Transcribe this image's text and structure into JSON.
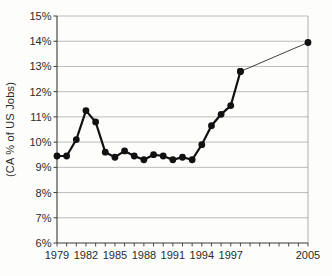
{
  "chart_data": {
    "type": "line",
    "title": "",
    "xlabel": "",
    "ylabel": "(CA % of US Jobs)",
    "xlim": [
      1979,
      2005
    ],
    "ylim": [
      6,
      15
    ],
    "grid": "horizontal",
    "legend_position": "none",
    "y_tick_labels": [
      "6%",
      "7%",
      "8%",
      "9%",
      "10%",
      "11%",
      "12%",
      "13%",
      "14%",
      "15%"
    ],
    "y_tick_values": [
      6,
      7,
      8,
      9,
      10,
      11,
      12,
      13,
      14,
      15
    ],
    "x_tick_labels": [
      "1979",
      "1982",
      "1985",
      "1988",
      "1991",
      "1994",
      "1997",
      "2005"
    ],
    "x_tick_values": [
      1979,
      1982,
      1985,
      1988,
      1991,
      1994,
      1997,
      2005
    ],
    "minor_x_tick_step_years": 1,
    "series": [
      {
        "name": "CA share of US jobs 1979-1998",
        "line_style": "thick",
        "markers": true,
        "x": [
          1979,
          1980,
          1981,
          1982,
          1983,
          1984,
          1985,
          1986,
          1987,
          1988,
          1989,
          1990,
          1991,
          1992,
          1993,
          1994,
          1995,
          1996,
          1997,
          1998
        ],
        "y": [
          9.45,
          9.45,
          10.1,
          11.25,
          10.8,
          9.6,
          9.4,
          9.65,
          9.45,
          9.3,
          9.5,
          9.45,
          9.3,
          9.4,
          9.3,
          9.9,
          10.65,
          11.1,
          11.45,
          12.8
        ]
      },
      {
        "name": "connector 1998 to 2005",
        "line_style": "thin",
        "markers": true,
        "x": [
          1998,
          2005
        ],
        "y": [
          12.8,
          13.95
        ]
      }
    ],
    "marker": {
      "shape": "circle",
      "radius": 3.4
    },
    "colors": {
      "line": "#111111",
      "marker": "#111111",
      "grid": "#ababab",
      "axis": "#3a3a3a",
      "plot_border": "#9a9a9a",
      "text": "#2a2a2a",
      "background": "#fdfdfc"
    }
  }
}
